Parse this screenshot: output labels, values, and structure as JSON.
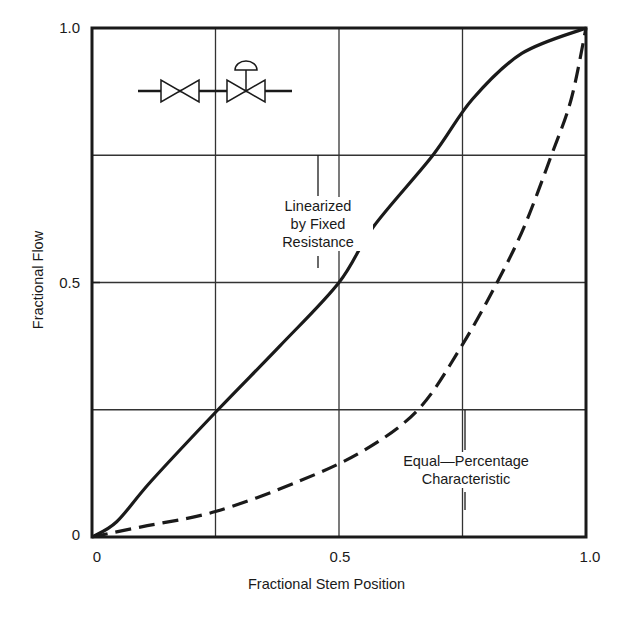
{
  "chart_data": {
    "type": "line",
    "title": "",
    "xlabel": "Fractional Stem Position",
    "ylabel": "Fractional Flow",
    "xlim": [
      0,
      1.0
    ],
    "ylim": [
      0,
      1.0
    ],
    "x_ticks": [
      {
        "value": 0,
        "label": "0"
      },
      {
        "value": 0.5,
        "label": "0.5"
      },
      {
        "value": 1.0,
        "label": "1.0"
      }
    ],
    "y_ticks": [
      {
        "value": 0,
        "label": "0"
      },
      {
        "value": 0.5,
        "label": "0.5"
      },
      {
        "value": 1.0,
        "label": "1.0"
      }
    ],
    "grid": {
      "on": true,
      "x_lines": [
        0.25,
        0.5,
        0.75
      ],
      "y_lines": [
        0.25,
        0.5,
        0.75
      ]
    },
    "legend": "none (inline annotations)",
    "series": [
      {
        "name": "Linearized by Fixed Resistance",
        "style": "solid",
        "x": [
          0,
          0.05,
          0.12,
          0.255,
          0.38,
          0.5,
          0.57,
          0.69,
          0.77,
          0.87,
          1.0
        ],
        "y": [
          0,
          0.03,
          0.11,
          0.25,
          0.375,
          0.5,
          0.61,
          0.75,
          0.86,
          0.95,
          1.0
        ]
      },
      {
        "name": "Equal-Percentage Characteristic",
        "style": "dashed",
        "x": [
          0,
          0.1,
          0.25,
          0.42,
          0.55,
          0.66,
          0.745,
          0.82,
          0.875,
          0.93,
          0.97,
          1.0
        ],
        "y": [
          0,
          0.02,
          0.05,
          0.11,
          0.17,
          0.25,
          0.37,
          0.5,
          0.61,
          0.75,
          0.86,
          1.0
        ]
      }
    ],
    "annotations": [
      {
        "text_lines": [
          "Linearized",
          "by Fixed",
          "Resistance"
        ],
        "points_to": "solid curve"
      },
      {
        "text_lines": [
          "Equal—Percentage",
          "Characteristic"
        ],
        "points_to": "dashed curve"
      }
    ],
    "inset_icon": "two-valves-in-series (manual valve + diaphragm-actuated control valve)"
  },
  "labels": {
    "xlabel": "Fractional Stem Position",
    "ylabel": "Fractional Flow",
    "y_tick_1": "1.0",
    "y_tick_05": "0.5",
    "y_tick_0": "0",
    "x_tick_0": "0",
    "x_tick_05": "0.5",
    "x_tick_1": "1.0",
    "ann_linear_1": "Linearized",
    "ann_linear_2": "by Fixed",
    "ann_linear_3": "Resistance",
    "ann_eq_1": "Equal—Percentage",
    "ann_eq_2": "Characteristic"
  },
  "colors": {
    "ink": "#1a1a1a",
    "grid": "#333333",
    "background": "#ffffff"
  }
}
